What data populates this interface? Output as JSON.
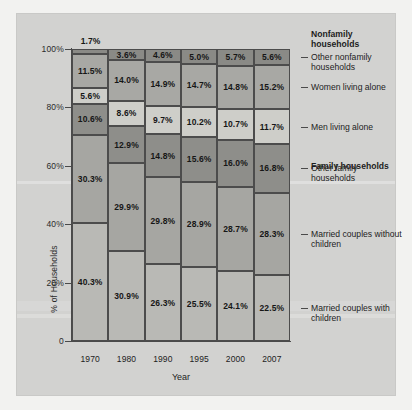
{
  "chart_data": {
    "type": "bar",
    "subtype": "stacked-percent",
    "title": "",
    "xlabel": "Year",
    "ylabel": "% of Households",
    "ylim": [
      0,
      100
    ],
    "ytick_labels": [
      "0",
      "20%",
      "40%",
      "60%",
      "80%",
      "100%"
    ],
    "ytick_values": [
      0,
      20,
      40,
      60,
      80,
      100
    ],
    "grid": false,
    "legend_position": "right",
    "categories": [
      "1970",
      "1980",
      "1990",
      "1995",
      "2000",
      "2007"
    ],
    "series": [
      {
        "name": "Married couples with children",
        "values": [
          40.3,
          30.9,
          26.3,
          25.5,
          24.1,
          22.5
        ],
        "labels": [
          "40.3%",
          "30.9%",
          "26.3%",
          "25.5%",
          "24.1%",
          "22.5%"
        ],
        "color": "#b9b9b5"
      },
      {
        "name": "Married couples without children",
        "values": [
          30.3,
          29.9,
          29.8,
          28.9,
          28.7,
          28.3
        ],
        "labels": [
          "30.3%",
          "29.9%",
          "29.8%",
          "28.9%",
          "28.7%",
          "28.3%"
        ],
        "color": "#a6a6a2"
      },
      {
        "name": "Other family households",
        "values": [
          10.6,
          12.9,
          14.8,
          15.6,
          16.0,
          16.8
        ],
        "labels": [
          "10.6%",
          "12.9%",
          "14.8%",
          "15.6%",
          "16.0%",
          "16.8%"
        ],
        "color": "#8e8e8a"
      },
      {
        "name": "Men living alone",
        "values": [
          5.6,
          8.6,
          9.7,
          10.2,
          10.7,
          11.7
        ],
        "labels": [
          "5.6%",
          "8.6%",
          "9.7%",
          "10.2%",
          "10.7%",
          "11.7%"
        ],
        "color": "#cecec9"
      },
      {
        "name": "Women living alone",
        "values": [
          11.5,
          14.0,
          14.9,
          14.7,
          14.8,
          15.2
        ],
        "labels": [
          "11.5%",
          "14.0%",
          "14.9%",
          "14.7%",
          "14.8%",
          "15.2%"
        ],
        "color": "#a8a8a4"
      },
      {
        "name": "Other nonfamily households",
        "values": [
          1.7,
          3.6,
          4.6,
          5.0,
          5.7,
          5.6
        ],
        "labels": [
          "1.7%",
          "3.6%",
          "4.6%",
          "5.0%",
          "5.7%",
          "5.6%"
        ],
        "color": "#8a8a86"
      }
    ],
    "annotations": [
      {
        "text": "1.7%",
        "attached_to": "1970 / Other nonfamily households",
        "placement": "above-bar"
      }
    ]
  },
  "axis": {
    "y_title": "% of Households",
    "x_title": "Year",
    "y_labels": {
      "t100": "100%",
      "t80": "80%",
      "t60": "60%",
      "t40": "40%",
      "t20": "20%",
      "t0": "0"
    },
    "x_labels": {
      "c0": "1970",
      "c1": "1980",
      "c2": "1990",
      "c3": "1995",
      "c4": "2000",
      "c5": "2007"
    }
  },
  "legend": {
    "group_nonfamily": "Nonfamily households",
    "group_family": "Family households",
    "item_other_nonfamily": "Other nonfamily households",
    "item_women_alone": "Women living alone",
    "item_men_alone": "Men living alone",
    "item_other_family": "Other family households",
    "item_married_without": "Married couples without children",
    "item_married_with": "Married couples with children"
  },
  "external_labels": {
    "bar1970_top": "1.7%"
  },
  "values": {
    "b0": {
      "s0": "40.3%",
      "s1": "30.3%",
      "s2": "10.6%",
      "s3": "5.6%",
      "s4": "11.5%",
      "s5": "1.7%"
    },
    "b1": {
      "s0": "30.9%",
      "s1": "29.9%",
      "s2": "12.9%",
      "s3": "8.6%",
      "s4": "14.0%",
      "s5": "3.6%"
    },
    "b2": {
      "s0": "26.3%",
      "s1": "29.8%",
      "s2": "14.8%",
      "s3": "9.7%",
      "s4": "14.9%",
      "s5": "4.6%"
    },
    "b3": {
      "s0": "25.5%",
      "s1": "28.9%",
      "s2": "15.6%",
      "s3": "10.2%",
      "s4": "14.7%",
      "s5": "5.0%"
    },
    "b4": {
      "s0": "24.1%",
      "s1": "28.7%",
      "s2": "16.0%",
      "s3": "10.7%",
      "s4": "14.8%",
      "s5": "5.7%"
    },
    "b5": {
      "s0": "22.5%",
      "s1": "28.3%",
      "s2": "16.8%",
      "s3": "11.7%",
      "s4": "15.2%",
      "s5": "5.6%"
    }
  },
  "colors": {
    "page_background": "#f2f2f0",
    "figure_background": "#d2d2d0",
    "axis": "#4a4a4a",
    "segment_border": "#4c4c4c",
    "text": "#1d1d1d"
  }
}
